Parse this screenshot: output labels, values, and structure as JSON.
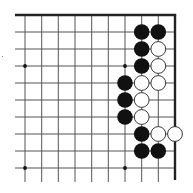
{
  "board": {
    "type": "go-diagram",
    "region": "top-right corner",
    "grid": {
      "x_lines": [
        25,
        41.7,
        58.3,
        75,
        91.7,
        108.3,
        125,
        141.7,
        158.3,
        175
      ],
      "y_lines": [
        15,
        32,
        49,
        66,
        83,
        100,
        117,
        134,
        151,
        168
      ],
      "line_color": "#555555",
      "edge_color": "#222222",
      "x_extend_left": 15,
      "y_extend_bottom": 182
    },
    "edges": [
      "top",
      "right"
    ],
    "hoshi": [
      {
        "col": 0,
        "row": 3
      },
      {
        "col": 6,
        "row": 3
      },
      {
        "col": 0,
        "row": 9
      },
      {
        "col": 6,
        "row": 9
      }
    ],
    "stone_radius": 7.8,
    "stones": [
      {
        "color": "black",
        "col": 7,
        "row": 1
      },
      {
        "color": "black",
        "col": 8,
        "row": 1
      },
      {
        "color": "black",
        "col": 7,
        "row": 2
      },
      {
        "color": "white",
        "col": 8,
        "row": 2
      },
      {
        "color": "black",
        "col": 7,
        "row": 3
      },
      {
        "color": "white",
        "col": 8,
        "row": 3
      },
      {
        "color": "black",
        "col": 6,
        "row": 4
      },
      {
        "color": "white",
        "col": 7,
        "row": 4
      },
      {
        "color": "white",
        "col": 8,
        "row": 4
      },
      {
        "color": "black",
        "col": 6,
        "row": 5
      },
      {
        "color": "white",
        "col": 7,
        "row": 5
      },
      {
        "color": "black",
        "col": 6,
        "row": 6
      },
      {
        "color": "white",
        "col": 7,
        "row": 6
      },
      {
        "color": "black",
        "col": 7,
        "row": 7
      },
      {
        "color": "white",
        "col": 8,
        "row": 7
      },
      {
        "color": "white",
        "col": 9,
        "row": 7
      },
      {
        "color": "black",
        "col": 7,
        "row": 8
      },
      {
        "color": "black",
        "col": 8,
        "row": 8
      }
    ],
    "colors": {
      "black_stone": "#111111",
      "white_stone": "#ffffff",
      "white_stone_outline": "#222222",
      "background": "#ffffff"
    }
  }
}
